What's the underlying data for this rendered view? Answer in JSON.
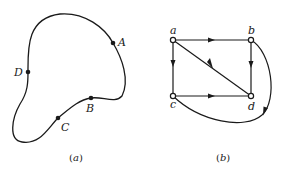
{
  "figure_a": {
    "caption_open": "(",
    "caption_letter": "a",
    "caption_close": ")",
    "points": [
      {
        "label": "A",
        "x": 113,
        "y": 43
      },
      {
        "label": "D",
        "x": 28,
        "y": 72
      },
      {
        "label": "B",
        "x": 91,
        "y": 98
      },
      {
        "label": "C",
        "x": 58,
        "y": 118
      }
    ],
    "curve": "closed"
  },
  "figure_b": {
    "caption_open": "(",
    "caption_letter": "b",
    "caption_close": ")",
    "vertices": [
      {
        "label": "a",
        "x": 173,
        "y": 40
      },
      {
        "label": "b",
        "x": 251,
        "y": 40
      },
      {
        "label": "c",
        "x": 173,
        "y": 96
      },
      {
        "label": "d",
        "x": 251,
        "y": 96
      }
    ],
    "edges": [
      {
        "from": "a",
        "to": "b",
        "type": "straight"
      },
      {
        "from": "a",
        "to": "c",
        "type": "straight"
      },
      {
        "from": "a",
        "to": "d",
        "type": "straight"
      },
      {
        "from": "b",
        "to": "d",
        "type": "straight"
      },
      {
        "from": "c",
        "to": "d",
        "type": "straight"
      },
      {
        "from": "b",
        "to": "c",
        "type": "curved",
        "note": "arc around the right and bottom, arrow pointing toward c side"
      }
    ]
  },
  "colors": {
    "stroke": "#1a1a1a",
    "background": "#ffffff"
  }
}
